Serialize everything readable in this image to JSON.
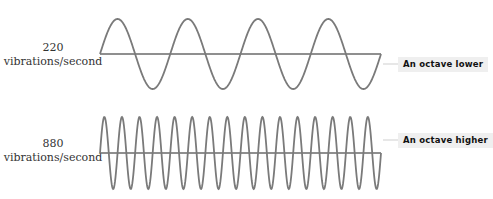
{
  "waves": [
    {
      "id": "low",
      "frequency": "220",
      "unit": "vibrations/second",
      "cycles": 4,
      "callout": "An octave lower"
    },
    {
      "id": "high",
      "frequency": "880",
      "unit": "vibrations/second",
      "cycles": 16,
      "callout": "An octave higher"
    }
  ],
  "colors": {
    "wave": "#7a7a7a",
    "axis": "#6a6a6a",
    "callout_bg": "#efefef",
    "text": "#333333"
  }
}
